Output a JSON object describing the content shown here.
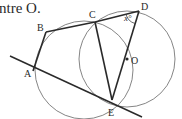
{
  "caption": "ntre O.",
  "colors": {
    "ink": "#2a2a2a",
    "circle": "#555555",
    "background": "#ffffff"
  },
  "points": {
    "A": {
      "label": "A",
      "x": 33,
      "y": 71,
      "lx": 24,
      "ly": 77
    },
    "B": {
      "label": "B",
      "x": 46,
      "y": 32,
      "lx": 37,
      "ly": 31
    },
    "C": {
      "label": "C",
      "x": 95,
      "y": 22,
      "lx": 89,
      "ly": 18
    },
    "D": {
      "label": "D",
      "x": 139,
      "y": 11,
      "lx": 141,
      "ly": 10
    },
    "O": {
      "label": "O",
      "x": 127,
      "y": 59,
      "lx": 131,
      "ly": 64
    },
    "E": {
      "label": "E",
      "x": 112,
      "y": 100,
      "lx": 108,
      "ly": 116
    }
  },
  "angle_label": "x°",
  "circles": [
    {
      "name": "circle-abce",
      "cx": 84,
      "cy": 70,
      "r": 49
    },
    {
      "name": "circle-centre-o",
      "cx": 127,
      "cy": 59,
      "r": 48
    }
  ],
  "tangent_line": {
    "x1": 10,
    "y1": 56,
    "x2": 142,
    "y2": 117
  }
}
